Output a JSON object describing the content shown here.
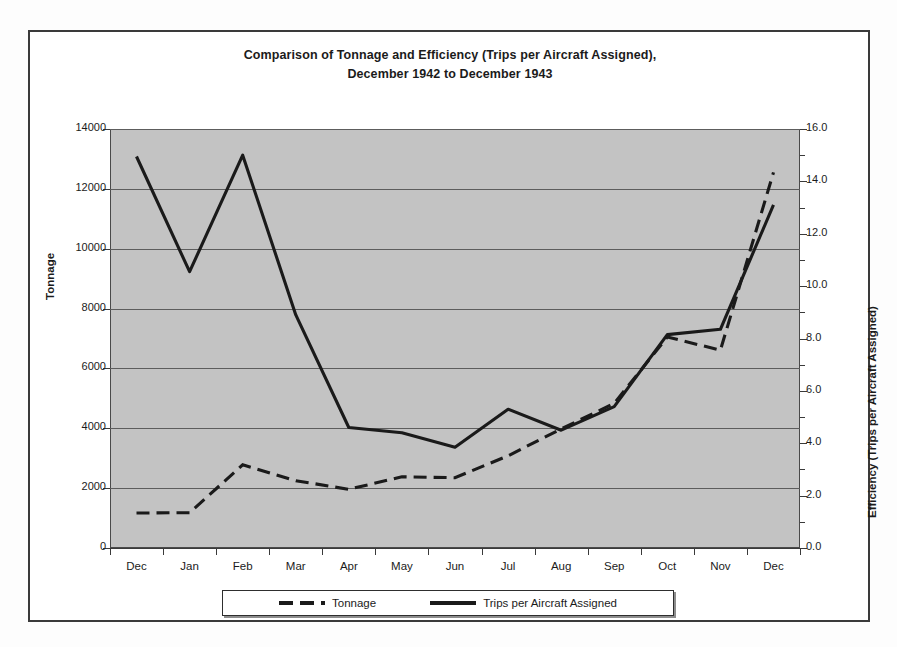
{
  "figure": {
    "title_line1": "Comparison of Tonnage and Efficiency (Trips per Aircraft Assigned),",
    "title_line2": "December 1942 to December 1943",
    "plot_background": "#c3c3c3",
    "line_color": "#1a1a1a",
    "frame_color": "#3a3a3a"
  },
  "axes": {
    "left_title": "Tonnage",
    "right_title": "Efficiency (Trips per Aircraft Assigned)",
    "left_ticks": [
      "0",
      "2000",
      "4000",
      "6000",
      "8000",
      "10000",
      "12000",
      "14000"
    ],
    "right_ticks": [
      "0.0",
      "2.0",
      "4.0",
      "6.0",
      "8.0",
      "10.0",
      "12.0",
      "14.0",
      "16.0"
    ]
  },
  "legend": {
    "items": [
      {
        "label": "Tonnage",
        "style": "dashed"
      },
      {
        "label": "Trips per Aircraft Assigned",
        "style": "solid"
      }
    ]
  },
  "chart_data": {
    "type": "line",
    "title": "Comparison of Tonnage and Efficiency (Trips per Aircraft Assigned), December 1942 to December 1943",
    "xlabel": "",
    "categories": [
      "Dec",
      "Jan",
      "Feb",
      "Mar",
      "Apr",
      "May",
      "Jun",
      "Jul",
      "Aug",
      "Sep",
      "Oct",
      "Nov",
      "Dec"
    ],
    "grid": true,
    "legend_position": "bottom",
    "series": [
      {
        "name": "Tonnage",
        "axis": "left",
        "ylabel": "Tonnage",
        "ylim": [
          0,
          14000
        ],
        "ytick_step": 2000,
        "style": "dashed",
        "values": [
          1170,
          1180,
          2780,
          2250,
          1960,
          2380,
          2350,
          3080,
          3980,
          4830,
          7050,
          6610,
          12550
        ]
      },
      {
        "name": "Trips per Aircraft Assigned",
        "axis": "right",
        "ylabel": "Efficiency (Trips per Aircraft Assigned)",
        "ylim": [
          0.0,
          16.0
        ],
        "ytick_step": 2.0,
        "style": "solid",
        "values": [
          14.95,
          10.55,
          15.0,
          8.9,
          4.6,
          4.4,
          3.85,
          5.3,
          4.5,
          5.4,
          8.15,
          8.35,
          13.1
        ]
      }
    ]
  }
}
